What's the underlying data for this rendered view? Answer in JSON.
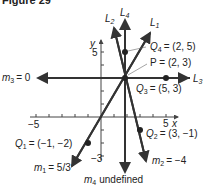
{
  "figure": {
    "title": "Figure 29"
  },
  "axes": {
    "x_label": "x",
    "y_label": "y",
    "x_tick_label": "5",
    "x_neg_tick_label": "−5",
    "y_tick_label": "5",
    "y_neg_tick_label": "−3"
  },
  "lines": {
    "L1": {
      "name": "L",
      "sub": "1",
      "slope_label": "m",
      "slope_sub": "1",
      "slope_value": "= 5/3"
    },
    "L2": {
      "name": "L",
      "sub": "2",
      "slope_label": "m",
      "slope_sub": "2",
      "slope_value": "= −4"
    },
    "L3": {
      "name": "L",
      "sub": "3",
      "slope_label": "m",
      "slope_sub": "3",
      "slope_value": "= 0"
    },
    "L4": {
      "name": "L",
      "sub": "4",
      "slope_label": "m",
      "slope_sub": "4",
      "slope_value": "undefined"
    }
  },
  "points": {
    "P": {
      "label": "P = (2, 3)"
    },
    "Q1": {
      "name": "Q",
      "sub": "1",
      "value": "= (−1, −2)"
    },
    "Q2": {
      "name": "Q",
      "sub": "2",
      "value": "= (3, −1)"
    },
    "Q3": {
      "name": "Q",
      "sub": "3",
      "value": "= (5, 3)"
    },
    "Q4": {
      "name": "Q",
      "sub": "4",
      "value": "= (2, 5)"
    }
  },
  "colors": {
    "line": "#333333",
    "axis": "#444444",
    "text": "#222222"
  }
}
